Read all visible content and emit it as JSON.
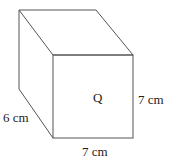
{
  "diagram": {
    "type": "cuboid",
    "face_label": "Q",
    "dimensions": {
      "depth": "6 cm",
      "height": "7 cm",
      "width": "7 cm"
    },
    "line_color": "#555555"
  }
}
